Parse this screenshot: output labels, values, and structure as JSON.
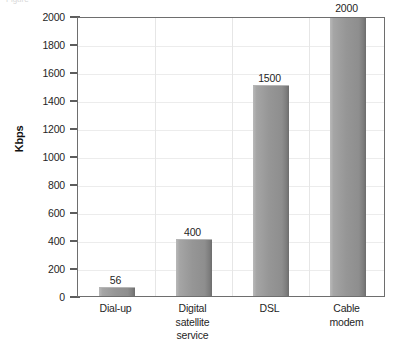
{
  "caption": {
    "text": "Figure"
  },
  "chart_data": {
    "type": "bar",
    "title": "",
    "xlabel": "",
    "ylabel": "Kbps",
    "categories": [
      "Dial-up",
      "Digital\nsatellite\nservice",
      "DSL",
      "Cable\nmodem"
    ],
    "values": [
      56,
      400,
      1500,
      2000
    ],
    "value_labels": [
      "56",
      "400",
      "1500",
      "2000"
    ],
    "ylim": [
      0,
      2000
    ],
    "ytick_step": 200,
    "ytick_labels": [
      "0",
      "200",
      "400",
      "600",
      "800",
      "1000",
      "1200",
      "1400",
      "1600",
      "1800",
      "2000"
    ],
    "grid": {
      "horizontal": true,
      "vertical": true
    },
    "legend": {
      "visible": false,
      "position": "none"
    },
    "colors": {
      "bar_light": "#b9b9b9",
      "bar_mid": "#969696",
      "bar_dark": "#6d6d6d",
      "frame": "#6e6e6e",
      "gridline": "#ececec",
      "text": "#1f1f1f",
      "background": "#ffffff"
    }
  }
}
